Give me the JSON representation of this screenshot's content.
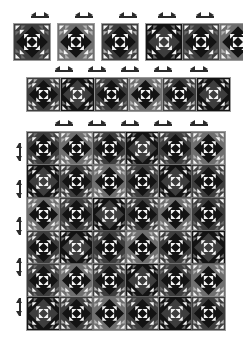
{
  "document": {
    "title": "Quilt Block Layout",
    "type": "diagram"
  },
  "palette": {
    "black": "#131313",
    "dark_gray": "#3e3e3e",
    "mid_gray": "#6f6f6f",
    "light_gray": "#b4b4b4",
    "white": "#f4f4f4",
    "grid_line": "#9a9a9a",
    "marker": "#2b2b2b",
    "background": "#ffffff"
  },
  "markers": {
    "horizontal_icon": "left-right-arrow-icon",
    "vertical_icon": "up-down-arrow-icon",
    "top_row_count": 5,
    "middle_row_count": 5,
    "grid_top_count": 5,
    "grid_left_count": 5
  },
  "sample_row": {
    "label": "sample-blocks-row",
    "solo_blocks": [
      {
        "name": "block-a",
        "variant": 0
      },
      {
        "name": "block-b",
        "variant": 1
      },
      {
        "name": "block-c",
        "variant": 2
      }
    ],
    "joined_blocks": [
      {
        "name": "block-d",
        "variant": 3
      },
      {
        "name": "block-e",
        "variant": 0
      },
      {
        "name": "block-f",
        "variant": 1
      }
    ]
  },
  "middle_strip": {
    "label": "block-strip-row",
    "blocks": [
      {
        "name": "strip-block-1",
        "variant": 2
      },
      {
        "name": "strip-block-2",
        "variant": 3
      },
      {
        "name": "strip-block-3",
        "variant": 0
      },
      {
        "name": "strip-block-4",
        "variant": 1
      },
      {
        "name": "strip-block-5",
        "variant": 2
      },
      {
        "name": "strip-block-6",
        "variant": 3
      }
    ]
  },
  "layout_grid": {
    "label": "quilt-layout-grid",
    "columns": 6,
    "rows": 6,
    "cells": [
      [
        0,
        1,
        2,
        3,
        0,
        1
      ],
      [
        3,
        2,
        1,
        0,
        3,
        2
      ],
      [
        1,
        0,
        3,
        2,
        1,
        0
      ],
      [
        2,
        3,
        0,
        1,
        2,
        3
      ],
      [
        0,
        1,
        2,
        3,
        0,
        1
      ],
      [
        3,
        2,
        1,
        0,
        3,
        2
      ]
    ]
  }
}
